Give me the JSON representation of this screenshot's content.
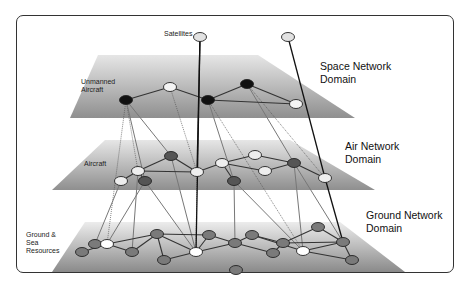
{
  "diagram": {
    "title_labels": {
      "satellites": "Satellites",
      "unmanned_aircraft": "Unmanned\nAircraft",
      "aircraft": "Aircraft",
      "ground_sea": "Ground &\nSea\nResources"
    },
    "domains": [
      {
        "id": "space",
        "label": "Space Network\nDomain"
      },
      {
        "id": "air",
        "label": "Air Network\nDomain"
      },
      {
        "id": "ground",
        "label": "Ground Network\nDomain"
      }
    ],
    "node_types": {
      "satellite": "#e2e2e2",
      "uav": "#111111",
      "uav_white": "#f4f4f4",
      "aircraft_dark": "#555555",
      "aircraft_light": "#eeeeee",
      "ground_gray": "#7a7a7a",
      "ground_white": "#ffffff"
    }
  }
}
